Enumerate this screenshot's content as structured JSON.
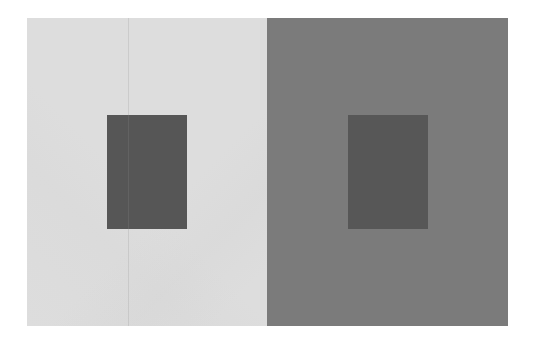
{
  "figure": {
    "type": "simultaneous-contrast-illusion",
    "panels": [
      {
        "name": "light-background",
        "background_color": "#dddddd",
        "inner_square_color": "#565656"
      },
      {
        "name": "dark-background",
        "background_color": "#7b7b7b",
        "inner_square_color": "#575757"
      }
    ]
  }
}
